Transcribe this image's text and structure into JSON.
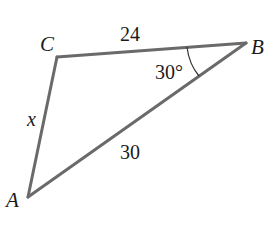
{
  "diagram": {
    "type": "triangle",
    "colors": {
      "line": "#6a6a6a",
      "text": "#1a1a1a",
      "background": "#ffffff"
    },
    "vertices": {
      "A": {
        "label": "A",
        "x": 28,
        "y": 197
      },
      "B": {
        "label": "B",
        "x": 246,
        "y": 43
      },
      "C": {
        "label": "C",
        "x": 57,
        "y": 57
      }
    },
    "sides": {
      "CB": {
        "label": "24"
      },
      "AB": {
        "label": "30"
      },
      "AC": {
        "label": "x"
      }
    },
    "angles": {
      "B": {
        "label": "30°"
      }
    }
  }
}
